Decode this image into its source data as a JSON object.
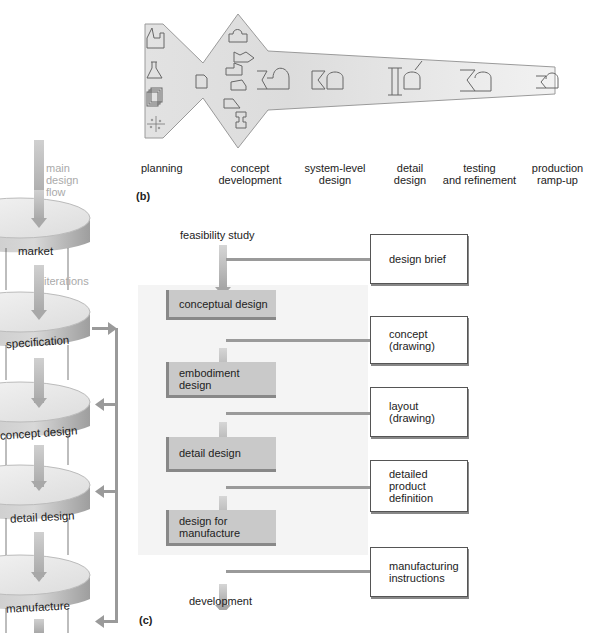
{
  "panel_b": {
    "tag": "(b)",
    "phases": [
      {
        "line1": "planning",
        "line2": ""
      },
      {
        "line1": "concept",
        "line2": "development"
      },
      {
        "line1": "system-level",
        "line2": "design"
      },
      {
        "line1": "detail",
        "line2": "design"
      },
      {
        "line1": "testing",
        "line2": "and refinement"
      },
      {
        "line1": "production",
        "line2": "ramp-up"
      }
    ],
    "icons": [
      "factory-icon",
      "flask-icon",
      "documents-icon",
      "scatter-icon",
      "document-icon",
      "part-sketch-icons",
      "assembly-icon"
    ]
  },
  "panel_a": {
    "flow_label": [
      "main",
      "design",
      "flow"
    ],
    "iterations_label": "iterations",
    "stages": [
      "market",
      "specification",
      "concept design",
      "detail design",
      "manufacture"
    ],
    "colors": {
      "disc_top": "#e6e6e6",
      "disc_side": "#b5b5b5",
      "arrow": "#b0b0b0",
      "feedback": "#9a9a9a"
    }
  },
  "panel_c": {
    "tag": "(c)",
    "input": "feasibility study",
    "output": "development",
    "stages": [
      {
        "line1": "conceptual design",
        "line2": ""
      },
      {
        "line1": "embodiment",
        "line2": "design"
      },
      {
        "line1": "detail design",
        "line2": ""
      },
      {
        "line1": "design for",
        "line2": "manufacture"
      }
    ],
    "documents": [
      {
        "lines": [
          "design brief"
        ]
      },
      {
        "lines": [
          "concept",
          "(drawing)"
        ]
      },
      {
        "lines": [
          "layout",
          "(drawing)"
        ]
      },
      {
        "lines": [
          "detailed",
          "product",
          "definition"
        ]
      },
      {
        "lines": [
          "manufacturing",
          "instructions"
        ]
      }
    ],
    "colors": {
      "stage_fill": "#c9c9c9",
      "stage_border": "#888888",
      "panel_bg": "#f4f4f4"
    }
  }
}
